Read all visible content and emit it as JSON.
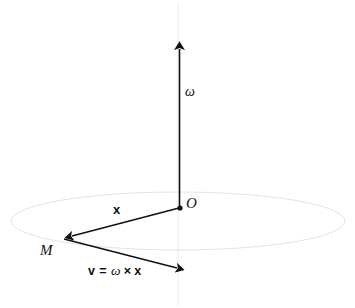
{
  "figure": {
    "background_color": "#ffffff",
    "ink_color": "#111111",
    "guide_color": "#e6e6e6",
    "labels": {
      "angular_velocity": "ω",
      "origin": "O",
      "mass_point": "M",
      "position_vector": "x",
      "velocity_relation": {
        "lhs": "v",
        "equals": "=",
        "omega": "ω",
        "cross": "×",
        "rhs": "x"
      }
    },
    "geometry": {
      "origin_point": {
        "x": 180,
        "y": 208
      },
      "mass_point": {
        "x": 63,
        "y": 238
      },
      "omega_arrow_tip": {
        "x": 179,
        "y": 41
      },
      "velocity_arrow_tip": {
        "x": 186,
        "y": 270
      },
      "circle": {
        "cx": 178,
        "cy": 221,
        "rx": 167,
        "ry": 29
      },
      "axis_guide_top": {
        "x": 178,
        "y": 2
      },
      "axis_guide_bottom": {
        "x": 178,
        "y": 306
      }
    }
  }
}
